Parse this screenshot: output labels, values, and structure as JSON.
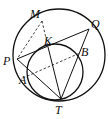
{
  "diagram": {
    "type": "geometry",
    "circles": [
      {
        "name": "outer-circle",
        "cx": 59,
        "cy": 55,
        "r": 46
      },
      {
        "name": "inner-circle",
        "cx": 55,
        "cy": 72,
        "r": 28
      }
    ],
    "points": {
      "M": {
        "label": "M",
        "x": 42,
        "y": 21,
        "lx": 30,
        "ly": 8
      },
      "Q": {
        "label": "Q",
        "x": 89,
        "y": 29,
        "lx": 91,
        "ly": 18
      },
      "P": {
        "label": "P",
        "x": 17,
        "y": 59,
        "lx": 3,
        "ly": 55
      },
      "K": {
        "label": "K",
        "x": 48,
        "y": 47,
        "lx": 44,
        "ly": 35
      },
      "B": {
        "label": "B",
        "x": 80,
        "y": 53,
        "lx": 81,
        "ly": 46
      },
      "A": {
        "label": "A",
        "x": 23,
        "y": 78,
        "lx": 19,
        "ly": 74
      },
      "T": {
        "label": "T",
        "x": 61,
        "y": 99,
        "lx": 55,
        "ly": 104
      }
    },
    "solid_segments": [
      [
        "P",
        "Q"
      ],
      [
        "P",
        "T"
      ],
      [
        "Q",
        "T"
      ],
      [
        "K",
        "T"
      ]
    ],
    "dashed_segments": [
      [
        "M",
        "P"
      ],
      [
        "M",
        "K"
      ],
      [
        "A",
        "B"
      ]
    ],
    "stroke_color": "#111111"
  }
}
